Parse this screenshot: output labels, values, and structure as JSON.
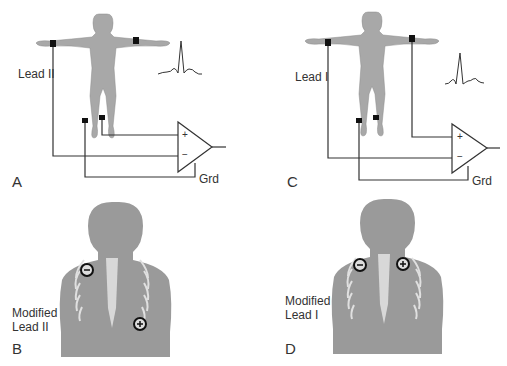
{
  "figure": {
    "panels": [
      {
        "id": "A",
        "lead_label": "Lead II",
        "ground_label": "Grd",
        "amp_plus": "+",
        "amp_minus": "−"
      },
      {
        "id": "B",
        "lead_label_line1": "Modified",
        "lead_label_line2": "Lead II"
      },
      {
        "id": "C",
        "lead_label": "Lead I",
        "ground_label": "Grd",
        "amp_plus": "+",
        "amp_minus": "−"
      },
      {
        "id": "D",
        "lead_label_line1": "Modified",
        "lead_label_line2": "Lead I"
      }
    ],
    "colors": {
      "body": "#a8a8a8",
      "chest": "#9a9a9a",
      "ribs": "#e0e0e0",
      "wire": "#333333",
      "electrode": "#111111"
    }
  }
}
